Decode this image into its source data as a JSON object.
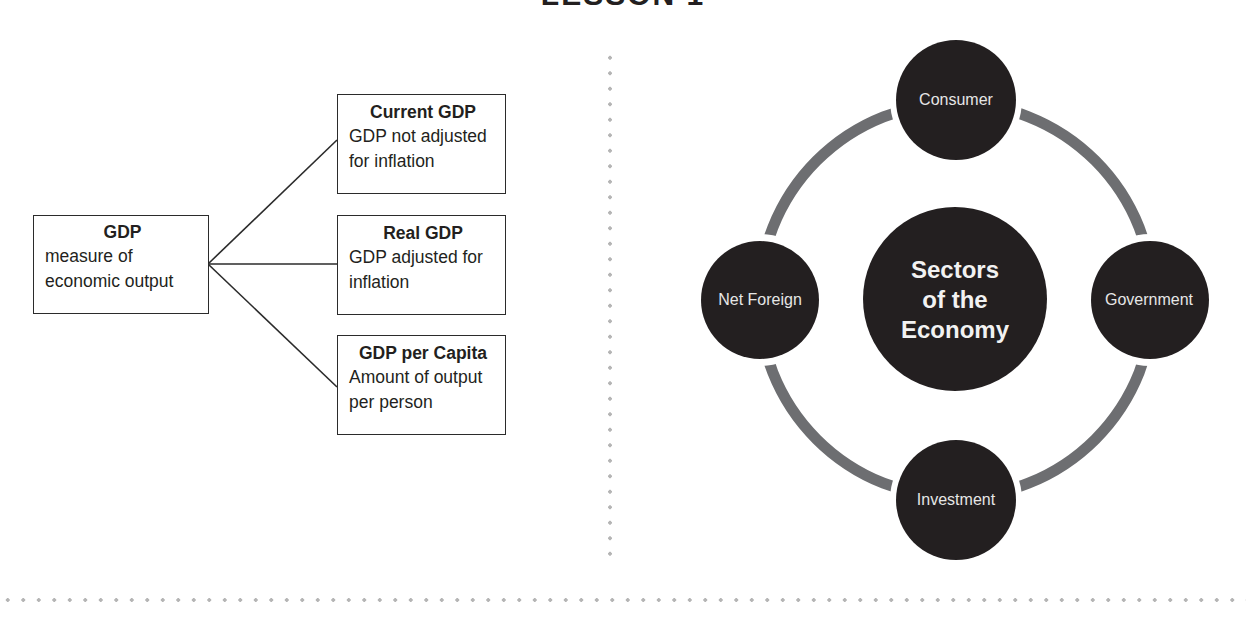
{
  "page": {
    "title": "LESSON 1"
  },
  "gdp_diagram": {
    "root": {
      "heading": "GDP",
      "description": "measure of economic output"
    },
    "branches": [
      {
        "heading": "Current GDP",
        "description": "GDP not adjusted for inflation"
      },
      {
        "heading": "Real GDP",
        "description": "GDP adjusted for inflation"
      },
      {
        "heading": "GDP per Capita",
        "description": "Amount of output per person"
      }
    ]
  },
  "sectors_diagram": {
    "center": "Sectors\nof the\nEconomy",
    "nodes": [
      {
        "label": "Consumer",
        "position": "top"
      },
      {
        "label": "Government",
        "position": "right"
      },
      {
        "label": "Investment",
        "position": "bottom"
      },
      {
        "label": "Net Foreign",
        "position": "left"
      }
    ],
    "colors": {
      "circle_fill": "#231f20",
      "ring_stroke": "#6d6e71",
      "label_text": "#e6e6e6"
    }
  }
}
